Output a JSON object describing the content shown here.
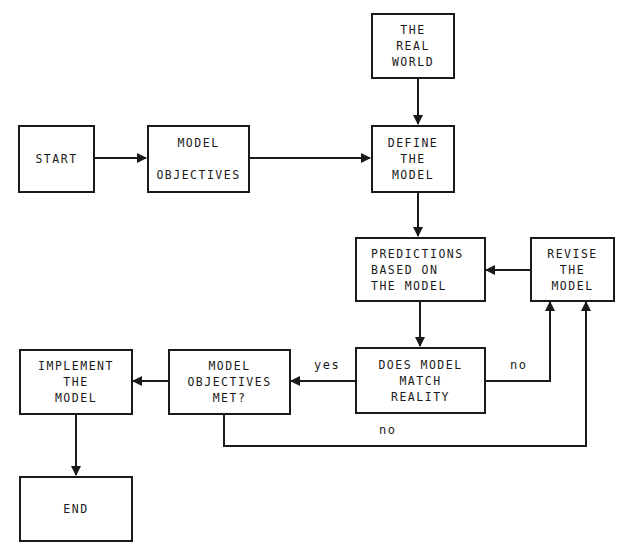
{
  "diagram": {
    "type": "flowchart",
    "nodes": {
      "real_world": {
        "lines": [
          "THE",
          "REAL",
          "WORLD"
        ]
      },
      "start": {
        "lines": [
          "START"
        ]
      },
      "model_objectives": {
        "lines": [
          "MODEL",
          "",
          "OBJECTIVES"
        ]
      },
      "define_model": {
        "lines": [
          "DEFINE",
          "THE",
          "MODEL"
        ]
      },
      "predictions": {
        "lines": [
          "PREDICTIONS",
          "BASED ON",
          "THE MODEL"
        ]
      },
      "revise_model": {
        "lines": [
          "REVISE",
          "THE",
          "MODEL"
        ]
      },
      "does_match": {
        "lines": [
          "DOES MODEL",
          "MATCH",
          "REALITY"
        ]
      },
      "objectives_met": {
        "lines": [
          "MODEL",
          "OBJECTIVES",
          "MET?"
        ]
      },
      "implement": {
        "lines": [
          "IMPLEMENT",
          "THE",
          "MODEL"
        ]
      },
      "end": {
        "lines": [
          "END"
        ]
      }
    },
    "edges": [
      {
        "from": "start",
        "to": "model_objectives",
        "label": ""
      },
      {
        "from": "model_objectives",
        "to": "define_model",
        "label": ""
      },
      {
        "from": "real_world",
        "to": "define_model",
        "label": ""
      },
      {
        "from": "define_model",
        "to": "predictions",
        "label": ""
      },
      {
        "from": "predictions",
        "to": "does_match",
        "label": ""
      },
      {
        "from": "does_match",
        "to": "objectives_met",
        "label": "yes"
      },
      {
        "from": "does_match",
        "to": "revise_model",
        "label": "no"
      },
      {
        "from": "objectives_met",
        "to": "revise_model",
        "label": "no"
      },
      {
        "from": "revise_model",
        "to": "predictions",
        "label": ""
      },
      {
        "from": "objectives_met",
        "to": "implement",
        "label": ""
      },
      {
        "from": "implement",
        "to": "end",
        "label": ""
      }
    ],
    "edge_labels": {
      "yes": "yes",
      "no_match": "no",
      "no_objectives": "no"
    }
  }
}
